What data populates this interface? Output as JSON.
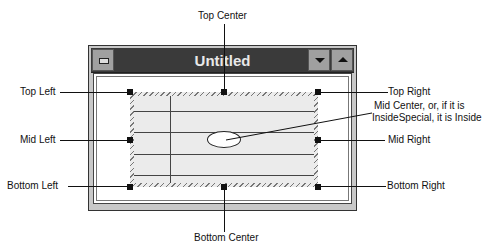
{
  "window": {
    "title": "Untitled",
    "buttons": {
      "control_menu": "control-menu",
      "minimize": "minimize",
      "maximize": "maximize"
    }
  },
  "labels": {
    "top_center": "Top Center",
    "top_left": "Top Left",
    "top_right": "Top Right",
    "mid_left": "Mid Left",
    "mid_center": "Mid Center, or, if it is",
    "mid_center_line2": "InsideSpecial, it is Inside",
    "mid_right": "Mid Right",
    "bottom_left": "Bottom Left",
    "bottom_right": "Bottom Right",
    "bottom_center": "Bottom Center"
  },
  "colors": {
    "titlebar": "#3a3a3a",
    "frame": "#c8c8c8",
    "selection_fill": "#ebebeb",
    "hatch": "#777777"
  }
}
